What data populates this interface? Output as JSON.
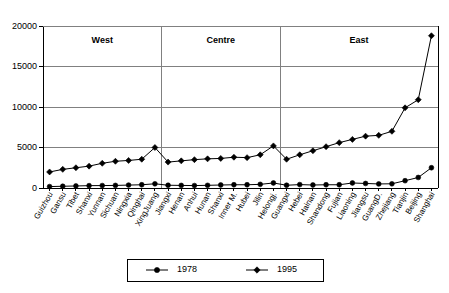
{
  "chart_data": {
    "type": "line",
    "title": "",
    "xlabel": "",
    "ylabel": "",
    "ylim": [
      0,
      20000
    ],
    "yticks": [
      0,
      5000,
      10000,
      15000,
      20000
    ],
    "ytick_labels": [
      "0",
      "5000",
      "10000",
      "15000",
      "20000"
    ],
    "grid": true,
    "legend_position": "bottom",
    "categories": [
      "Guizhou",
      "Gansu",
      "Tibet",
      "Shanxi",
      "Yunnan",
      "Sichuan",
      "Ningxia",
      "Qinghai",
      "XingJuang",
      "Jiangxi",
      "Henan",
      "Anhui",
      "Hunan",
      "Shanxi",
      "Inner M.",
      "Hubei",
      "Jilin",
      "Helongj.",
      "Guangxi",
      "Hebei",
      "Hainan",
      "Shandong",
      "Fujian",
      "Liaoning",
      "Jiangsu",
      "GuangD.",
      "Zhejiang",
      "Tianjin",
      "Beijing",
      "Shanghai"
    ],
    "series": [
      {
        "name": "1978",
        "marker": "circle",
        "values": [
          175,
          215,
          250,
          290,
          300,
          320,
          360,
          400,
          520,
          340,
          320,
          300,
          330,
          370,
          400,
          400,
          450,
          620,
          340,
          420,
          370,
          400,
          400,
          620,
          560,
          500,
          520,
          900,
          1300,
          2500
        ]
      },
      {
        "name": "1995",
        "marker": "diamond",
        "values": [
          1980,
          2300,
          2500,
          2700,
          3050,
          3300,
          3400,
          3550,
          5000,
          3200,
          3350,
          3500,
          3600,
          3650,
          3800,
          3750,
          4100,
          5200,
          3550,
          4100,
          4600,
          5100,
          5600,
          6000,
          6400,
          6500,
          7000,
          9900,
          10900,
          18800
        ]
      }
    ],
    "regions": [
      {
        "label": "West",
        "start_index": 0,
        "end_index": 8
      },
      {
        "label": "Centre",
        "start_index": 9,
        "end_index": 17
      },
      {
        "label": "East",
        "start_index": 18,
        "end_index": 29
      }
    ]
  },
  "legend": {
    "entries": [
      {
        "label": "1978",
        "marker": "circle"
      },
      {
        "label": "1995",
        "marker": "diamond"
      }
    ]
  },
  "colors": {
    "line": "#000000",
    "grid": "#808080",
    "axis": "#000000",
    "background": "#ffffff"
  }
}
